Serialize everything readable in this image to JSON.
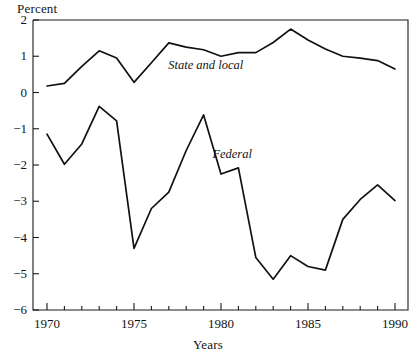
{
  "chart_data": {
    "type": "line",
    "title": "",
    "ylabel": "Percent",
    "xlabel": "Years",
    "xlim": [
      1970,
      1990
    ],
    "ylim": [
      -6,
      2
    ],
    "grid": false,
    "legend_position": "inline-annotations",
    "x": [
      1970,
      1971,
      1972,
      1973,
      1974,
      1975,
      1976,
      1977,
      1978,
      1979,
      1980,
      1981,
      1982,
      1983,
      1984,
      1985,
      1986,
      1987,
      1988,
      1989,
      1990
    ],
    "yticks": [
      2,
      1,
      0,
      -1,
      -2,
      -3,
      -4,
      -5,
      -6
    ],
    "ytick_labels": [
      "2",
      "1",
      "0",
      "−1",
      "−2",
      "−3",
      "−4",
      "−5",
      "−6"
    ],
    "xticks": [
      1970,
      1975,
      1980,
      1985,
      1990
    ],
    "xtick_labels": [
      "1970",
      "1975",
      "1980",
      "1985",
      "1990"
    ],
    "series": [
      {
        "name": "State and local",
        "label_x": 1980.3,
        "label_y": 0.72,
        "values": [
          0.18,
          0.25,
          0.72,
          1.15,
          0.95,
          0.28,
          0.82,
          1.37,
          1.25,
          1.18,
          1.0,
          1.1,
          1.1,
          1.38,
          1.75,
          1.45,
          1.2,
          1.0,
          0.95,
          0.88,
          0.65
        ]
      },
      {
        "name": "Federal",
        "label_x": 1981.0,
        "label_y": -1.72,
        "values": [
          -1.15,
          -1.98,
          -1.42,
          -0.38,
          -0.78,
          -4.3,
          -3.2,
          -2.75,
          -1.6,
          -0.62,
          -2.25,
          -2.08,
          -4.55,
          -5.15,
          -4.5,
          -4.8,
          -4.9,
          -3.5,
          -2.95,
          -2.55,
          -2.98
        ]
      }
    ]
  },
  "labels": {
    "percent": "Percent",
    "years": "Years",
    "state_and_local": "State and local",
    "federal": "Federal"
  },
  "style": {
    "line_color": "#111111",
    "axis_color": "#1a1a1a",
    "background": "#ffffff"
  }
}
